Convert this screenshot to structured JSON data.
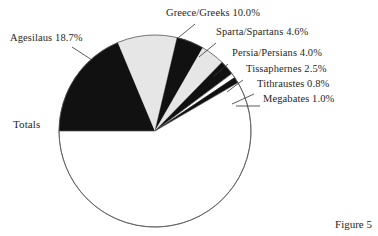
{
  "figure": {
    "caption": "Figure 5"
  },
  "chart_data": {
    "type": "pie",
    "title": "",
    "subtitle": "",
    "xlabel": "",
    "ylabel": "",
    "legend_position": "callout-labels",
    "grid": false,
    "units": "percent",
    "start_angle_deg": 180,
    "direction": "clockwise",
    "center": {
      "x": 155,
      "y": 131
    },
    "radius": 96,
    "categories": [
      "Agesilaus",
      "Greece/Greeks",
      "Sparta/Spartans",
      "Persia/Persians",
      "Tissaphernes",
      "Tithraustes",
      "Megabates",
      "Totals"
    ],
    "values": [
      18.7,
      10.0,
      4.6,
      4.0,
      2.5,
      0.8,
      1.0,
      58.4
    ],
    "slices": [
      {
        "name": "Agesilaus",
        "value": 18.7,
        "label": "Agesilaus 18.7%",
        "fill": "#111111",
        "start_deg": 180,
        "sweep_deg": 67.32
      },
      {
        "name": "Greece/Greeks",
        "value": 10.0,
        "label": "Greece/Greeks 10.0%",
        "fill": "#e6e6e6",
        "start_deg": 247.32,
        "sweep_deg": 36.0
      },
      {
        "name": "Sparta/Spartans",
        "value": 4.6,
        "label": "Sparta/Spartans 4.6%",
        "fill": "#111111",
        "start_deg": 283.32,
        "sweep_deg": 16.56
      },
      {
        "name": "Persia/Persians",
        "value": 4.0,
        "label": "Persia/Persians 4.0%",
        "fill": "#e6e6e6",
        "start_deg": 299.88,
        "sweep_deg": 14.4
      },
      {
        "name": "Tissaphernes",
        "value": 2.5,
        "label": "Tissaphernes 2.5%",
        "fill": "#111111",
        "start_deg": 314.28,
        "sweep_deg": 9.0
      },
      {
        "name": "Tithraustes",
        "value": 0.8,
        "label": "Tithraustes 0.8%",
        "fill": "#ffffff",
        "start_deg": 323.28,
        "sweep_deg": 2.88
      },
      {
        "name": "Megabates",
        "value": 1.0,
        "label": "Megabates 1.0%",
        "fill": "#111111",
        "start_deg": 326.16,
        "sweep_deg": 3.6
      },
      {
        "name": "Totals",
        "value": 58.4,
        "label": "Totals",
        "fill": "#ffffff",
        "start_deg": 329.76,
        "sweep_deg": 210.24
      }
    ],
    "colors": {
      "black": "#111111",
      "gray": "#e6e6e6",
      "white": "#ffffff",
      "outline": "#555555"
    }
  }
}
